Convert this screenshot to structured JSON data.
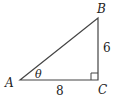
{
  "diagram": {
    "type": "right-triangle",
    "vertices": {
      "A": "A",
      "B": "B",
      "C": "C"
    },
    "angle_label": "θ",
    "sides": {
      "AC": "8",
      "BC": "6"
    },
    "right_angle_at": "C",
    "colors": {
      "stroke": "#444444",
      "text": "#222222"
    }
  }
}
